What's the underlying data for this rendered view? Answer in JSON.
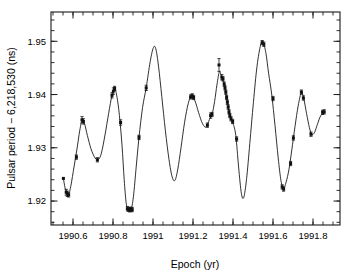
{
  "chart_data": {
    "type": "scatter",
    "title": "",
    "xlabel": "Epoch (yr)",
    "ylabel": "Pulsar period − 6,218,530 (ns)",
    "xlim": [
      1990.49,
      1991.935
    ],
    "ylim": [
      1.9155,
      1.9555
    ],
    "xticks": [
      1990.6,
      1990.8,
      1991.0,
      1991.2,
      1991.4,
      1991.6,
      1991.8
    ],
    "xticklabels": [
      "1990.6",
      "1990.8",
      "1991",
      "1991.2",
      "1991.4",
      "1991.6",
      "1991.8"
    ],
    "yticks": [
      1.92,
      1.93,
      1.94,
      1.95
    ],
    "yticklabels": [
      "1.92",
      "1.93",
      "1.94",
      "1.95"
    ],
    "x_minor_tick_step": 0.05,
    "y_minor_tick_step": 0.002,
    "grid": false,
    "legend": null,
    "legend_position": "none",
    "marker": "filled-square",
    "line_style": "solid-fitted-curve",
    "series": [
      {
        "name": "Pulsar period residual",
        "units": "ns",
        "points": [
          {
            "x": 1990.552,
            "y": 1.92425,
            "yerr": 0.0
          },
          {
            "x": 1990.566,
            "y": 1.92165,
            "yerr": 0.00055
          },
          {
            "x": 1990.572,
            "y": 1.92135,
            "yerr": 0.0005
          },
          {
            "x": 1990.578,
            "y": 1.92115,
            "yerr": 0.0004
          },
          {
            "x": 1990.617,
            "y": 1.92825,
            "yerr": 0.0004
          },
          {
            "x": 1990.645,
            "y": 1.93525,
            "yerr": 0.0006
          },
          {
            "x": 1990.652,
            "y": 1.93495,
            "yerr": 0.0005
          },
          {
            "x": 1990.722,
            "y": 1.92775,
            "yerr": 0.0004
          },
          {
            "x": 1990.795,
            "y": 1.93985,
            "yerr": 0.0005
          },
          {
            "x": 1990.802,
            "y": 1.94065,
            "yerr": 0.0006
          },
          {
            "x": 1990.808,
            "y": 1.94115,
            "yerr": 0.0004
          },
          {
            "x": 1990.838,
            "y": 1.93475,
            "yerr": 0.0005
          },
          {
            "x": 1990.872,
            "y": 1.91855,
            "yerr": 0.0004
          },
          {
            "x": 1990.878,
            "y": 1.91845,
            "yerr": 0.0004
          },
          {
            "x": 1990.884,
            "y": 1.91835,
            "yerr": 0.0004
          },
          {
            "x": 1990.89,
            "y": 1.91845,
            "yerr": 0.0004
          },
          {
            "x": 1990.896,
            "y": 1.9184,
            "yerr": 0.0004
          },
          {
            "x": 1990.93,
            "y": 1.93195,
            "yerr": 0.0004
          },
          {
            "x": 1990.966,
            "y": 1.94125,
            "yerr": 0.0005
          },
          {
            "x": 1991.188,
            "y": 1.93955,
            "yerr": 0.0004
          },
          {
            "x": 1991.196,
            "y": 1.93975,
            "yerr": 0.0004
          },
          {
            "x": 1991.203,
            "y": 1.93945,
            "yerr": 0.0004
          },
          {
            "x": 1991.272,
            "y": 1.93425,
            "yerr": 0.0004
          },
          {
            "x": 1991.288,
            "y": 1.93605,
            "yerr": 0.0005
          },
          {
            "x": 1991.295,
            "y": 1.93625,
            "yerr": 0.0004
          },
          {
            "x": 1991.33,
            "y": 1.94555,
            "yerr": 0.0012
          },
          {
            "x": 1991.344,
            "y": 1.94325,
            "yerr": 0.0005
          },
          {
            "x": 1991.35,
            "y": 1.94295,
            "yerr": 0.0004
          },
          {
            "x": 1991.356,
            "y": 1.94195,
            "yerr": 0.0004
          },
          {
            "x": 1991.36,
            "y": 1.94125,
            "yerr": 0.0004
          },
          {
            "x": 1991.364,
            "y": 1.94045,
            "yerr": 0.0004
          },
          {
            "x": 1991.368,
            "y": 1.93945,
            "yerr": 0.0004
          },
          {
            "x": 1991.372,
            "y": 1.93855,
            "yerr": 0.0004
          },
          {
            "x": 1991.376,
            "y": 1.93765,
            "yerr": 0.0004
          },
          {
            "x": 1991.38,
            "y": 1.93675,
            "yerr": 0.0004
          },
          {
            "x": 1991.384,
            "y": 1.93605,
            "yerr": 0.0004
          },
          {
            "x": 1991.39,
            "y": 1.93545,
            "yerr": 0.0004
          },
          {
            "x": 1991.398,
            "y": 1.93495,
            "yerr": 0.0004
          },
          {
            "x": 1991.418,
            "y": 1.93165,
            "yerr": 0.0004
          },
          {
            "x": 1991.546,
            "y": 1.94975,
            "yerr": 0.0004
          },
          {
            "x": 1991.554,
            "y": 1.94945,
            "yerr": 0.0004
          },
          {
            "x": 1991.6,
            "y": 1.93925,
            "yerr": 0.0004
          },
          {
            "x": 1991.646,
            "y": 1.92265,
            "yerr": 0.0004
          },
          {
            "x": 1991.653,
            "y": 1.92225,
            "yerr": 0.0004
          },
          {
            "x": 1991.688,
            "y": 1.92705,
            "yerr": 0.0004
          },
          {
            "x": 1991.702,
            "y": 1.93185,
            "yerr": 0.0004
          },
          {
            "x": 1991.742,
            "y": 1.94045,
            "yerr": 0.0004
          },
          {
            "x": 1991.752,
            "y": 1.93935,
            "yerr": 0.0004
          },
          {
            "x": 1991.79,
            "y": 1.93255,
            "yerr": 0.0004
          },
          {
            "x": 1991.848,
            "y": 1.93665,
            "yerr": 0.0004
          },
          {
            "x": 1991.856,
            "y": 1.93675,
            "yerr": 0.0004
          }
        ]
      }
    ],
    "fitted_curve": [
      {
        "x": 1990.552,
        "y": 1.92425
      },
      {
        "x": 1990.56,
        "y": 1.9225
      },
      {
        "x": 1990.568,
        "y": 1.92155
      },
      {
        "x": 1990.578,
        "y": 1.92115
      },
      {
        "x": 1990.59,
        "y": 1.923
      },
      {
        "x": 1990.605,
        "y": 1.9264
      },
      {
        "x": 1990.62,
        "y": 1.9298
      },
      {
        "x": 1990.634,
        "y": 1.9333
      },
      {
        "x": 1990.646,
        "y": 1.9352
      },
      {
        "x": 1990.658,
        "y": 1.9345
      },
      {
        "x": 1990.672,
        "y": 1.9323
      },
      {
        "x": 1990.69,
        "y": 1.9298
      },
      {
        "x": 1990.71,
        "y": 1.9281
      },
      {
        "x": 1990.726,
        "y": 1.92775
      },
      {
        "x": 1990.742,
        "y": 1.929
      },
      {
        "x": 1990.76,
        "y": 1.9324
      },
      {
        "x": 1990.778,
        "y": 1.9364
      },
      {
        "x": 1990.795,
        "y": 1.9399
      },
      {
        "x": 1990.808,
        "y": 1.9412
      },
      {
        "x": 1990.82,
        "y": 1.9395
      },
      {
        "x": 1990.832,
        "y": 1.9361
      },
      {
        "x": 1990.845,
        "y": 1.9305
      },
      {
        "x": 1990.856,
        "y": 1.924
      },
      {
        "x": 1990.866,
        "y": 1.9196
      },
      {
        "x": 1990.876,
        "y": 1.91845
      },
      {
        "x": 1990.89,
        "y": 1.9184
      },
      {
        "x": 1990.902,
        "y": 1.9208
      },
      {
        "x": 1990.916,
        "y": 1.9264
      },
      {
        "x": 1990.93,
        "y": 1.932
      },
      {
        "x": 1990.948,
        "y": 1.9376
      },
      {
        "x": 1990.966,
        "y": 1.9413
      },
      {
        "x": 1990.986,
        "y": 1.9462
      },
      {
        "x": 1991.002,
        "y": 1.9488
      },
      {
        "x": 1991.014,
        "y": 1.9486
      },
      {
        "x": 1991.028,
        "y": 1.9452
      },
      {
        "x": 1991.044,
        "y": 1.9396
      },
      {
        "x": 1991.062,
        "y": 1.9332
      },
      {
        "x": 1991.08,
        "y": 1.9278
      },
      {
        "x": 1991.096,
        "y": 1.9245
      },
      {
        "x": 1991.11,
        "y": 1.9239
      },
      {
        "x": 1991.124,
        "y": 1.926
      },
      {
        "x": 1991.14,
        "y": 1.93
      },
      {
        "x": 1991.158,
        "y": 1.9348
      },
      {
        "x": 1991.176,
        "y": 1.9383
      },
      {
        "x": 1991.192,
        "y": 1.9397
      },
      {
        "x": 1991.21,
        "y": 1.9388
      },
      {
        "x": 1991.228,
        "y": 1.9366
      },
      {
        "x": 1991.248,
        "y": 1.9345
      },
      {
        "x": 1991.266,
        "y": 1.9339
      },
      {
        "x": 1991.282,
        "y": 1.9353
      },
      {
        "x": 1991.296,
        "y": 1.9364
      },
      {
        "x": 1991.308,
        "y": 1.9387
      },
      {
        "x": 1991.32,
        "y": 1.9419
      },
      {
        "x": 1991.332,
        "y": 1.9443
      },
      {
        "x": 1991.342,
        "y": 1.9434
      },
      {
        "x": 1991.356,
        "y": 1.9419
      },
      {
        "x": 1991.37,
        "y": 1.939
      },
      {
        "x": 1991.384,
        "y": 1.9361
      },
      {
        "x": 1991.4,
        "y": 1.9346
      },
      {
        "x": 1991.414,
        "y": 1.9323
      },
      {
        "x": 1991.428,
        "y": 1.9264
      },
      {
        "x": 1991.442,
        "y": 1.9214
      },
      {
        "x": 1991.454,
        "y": 1.9207
      },
      {
        "x": 1991.468,
        "y": 1.9242
      },
      {
        "x": 1991.484,
        "y": 1.9308
      },
      {
        "x": 1991.502,
        "y": 1.9385
      },
      {
        "x": 1991.52,
        "y": 1.9453
      },
      {
        "x": 1991.538,
        "y": 1.9493
      },
      {
        "x": 1991.55,
        "y": 1.9498
      },
      {
        "x": 1991.564,
        "y": 1.9479
      },
      {
        "x": 1991.578,
        "y": 1.944
      },
      {
        "x": 1991.594,
        "y": 1.9399
      },
      {
        "x": 1991.61,
        "y": 1.9342
      },
      {
        "x": 1991.626,
        "y": 1.9281
      },
      {
        "x": 1991.64,
        "y": 1.9238
      },
      {
        "x": 1991.652,
        "y": 1.9223
      },
      {
        "x": 1991.666,
        "y": 1.9236
      },
      {
        "x": 1991.68,
        "y": 1.926
      },
      {
        "x": 1991.694,
        "y": 1.9296
      },
      {
        "x": 1991.71,
        "y": 1.934
      },
      {
        "x": 1991.726,
        "y": 1.9379
      },
      {
        "x": 1991.742,
        "y": 1.9404
      },
      {
        "x": 1991.754,
        "y": 1.9392
      },
      {
        "x": 1991.768,
        "y": 1.9364
      },
      {
        "x": 1991.782,
        "y": 1.9338
      },
      {
        "x": 1991.794,
        "y": 1.9325
      },
      {
        "x": 1991.808,
        "y": 1.9329
      },
      {
        "x": 1991.822,
        "y": 1.9344
      },
      {
        "x": 1991.838,
        "y": 1.936
      },
      {
        "x": 1991.856,
        "y": 1.93675
      }
    ]
  },
  "axes": {
    "x_title": "Epoch (yr)",
    "y_title": "Pulsar period − 6,218,530 (ns)"
  }
}
